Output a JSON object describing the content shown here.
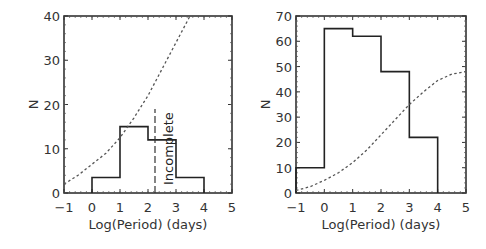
{
  "chart_data": [
    {
      "type": "bar",
      "style": "step-histogram",
      "title": "",
      "xlabel": "Log(Period) (days)",
      "ylabel": "N",
      "xlim": [
        -1,
        5
      ],
      "ylim": [
        0,
        40
      ],
      "xticks": [
        "-1",
        "0",
        "1",
        "2",
        "3",
        "4",
        "5"
      ],
      "yticks": [
        "0",
        "10",
        "20",
        "30",
        "40"
      ],
      "bins": [
        [
          0,
          1
        ],
        [
          1,
          2
        ],
        [
          2,
          3
        ],
        [
          3,
          4
        ]
      ],
      "values": [
        3.5,
        15,
        12,
        3.5
      ],
      "curve": {
        "style": "dotted",
        "x": [
          -1,
          -0.5,
          0,
          0.5,
          1,
          1.5,
          2,
          2.5,
          3,
          3.5
        ],
        "y": [
          2,
          4,
          6.5,
          9,
          12.5,
          17,
          22,
          28,
          34,
          40
        ]
      },
      "annotation": {
        "text": "Incomplete",
        "x": 2.25,
        "line_style": "dashed",
        "y_range": [
          0,
          19
        ]
      }
    },
    {
      "type": "bar",
      "style": "step-histogram",
      "title": "",
      "xlabel": "Log(Period) (days)",
      "ylabel": "N",
      "xlim": [
        -1,
        5
      ],
      "ylim": [
        0,
        70
      ],
      "xticks": [
        "-1",
        "0",
        "1",
        "2",
        "3",
        "4",
        "5"
      ],
      "yticks": [
        "0",
        "10",
        "20",
        "30",
        "40",
        "50",
        "60",
        "70"
      ],
      "bins": [
        [
          -1,
          0
        ],
        [
          0,
          1
        ],
        [
          1,
          2
        ],
        [
          2,
          3
        ],
        [
          3,
          4
        ]
      ],
      "values": [
        10,
        65,
        62,
        48,
        22
      ],
      "curve": {
        "style": "dotted",
        "x": [
          -1,
          -0.5,
          0,
          0.5,
          1,
          1.5,
          2,
          2.5,
          3,
          3.5,
          4,
          4.5,
          5
        ],
        "y": [
          1,
          2.5,
          5,
          8,
          12,
          17,
          23,
          29,
          35,
          40,
          44.5,
          47,
          48
        ]
      }
    }
  ]
}
